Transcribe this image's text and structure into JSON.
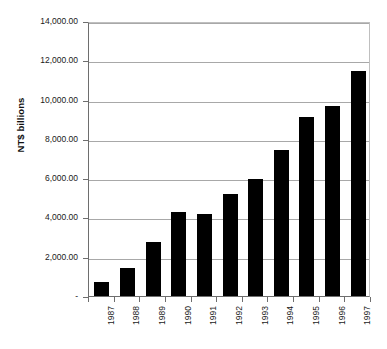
{
  "chart_data": {
    "type": "bar",
    "title": "",
    "subtitle": "",
    "xlabel": "",
    "ylabel": "NT$ billions",
    "categories": [
      "1987",
      "1988",
      "1989",
      "1990",
      "1991",
      "1992",
      "1993",
      "1994",
      "1995",
      "1996",
      "1997"
    ],
    "values": [
      700,
      1450,
      2760,
      4280,
      4180,
      5180,
      5980,
      7450,
      9100,
      9650,
      11440
    ],
    "ylim": [
      0,
      14000
    ],
    "ytick_values": [
      0,
      2000,
      4000,
      6000,
      8000,
      10000,
      12000,
      14000
    ],
    "ytick_labels": [
      "-",
      "2,000.00",
      "4,000.00",
      "6,000.00",
      "8,000.00",
      "10,000.00",
      "12,000.00",
      "14,000.00"
    ],
    "grid": true,
    "legend": false,
    "legend_position": "none",
    "bar_color": "#000000",
    "gridline_color": "#a8a8a8",
    "axis_color": "#6e6e6e",
    "background_color": "#ffffff",
    "xtick_rotation": -90,
    "ylabel_rotation": -90
  }
}
